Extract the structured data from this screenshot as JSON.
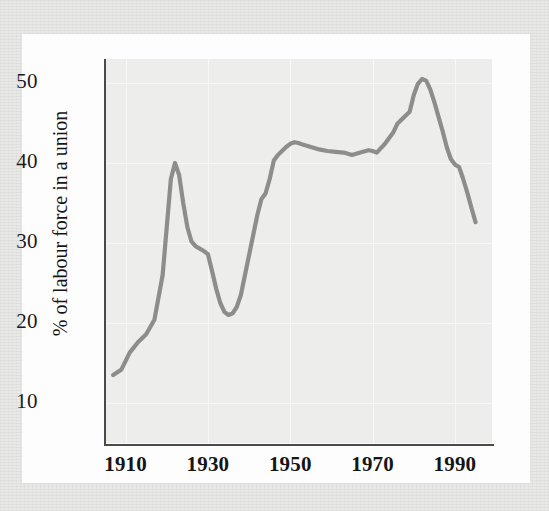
{
  "chart_data": {
    "type": "line",
    "title": "",
    "subtitle": "",
    "xlabel": "",
    "ylabel": "% of labour force in a union",
    "xlim": [
      1905,
      1999
    ],
    "ylim": [
      5,
      53
    ],
    "grid": true,
    "legend": "none",
    "x_ticks": [
      "1910",
      "1930",
      "1950",
      "1970",
      "1990"
    ],
    "x_tick_values": [
      1910,
      1930,
      1950,
      1970,
      1990
    ],
    "y_ticks": [
      "10",
      "20",
      "30",
      "40",
      "50"
    ],
    "y_tick_values": [
      10,
      20,
      30,
      40,
      50
    ],
    "series": [
      {
        "name": "Union density",
        "color": "#8d8d8d",
        "x": [
          1907,
          1909,
          1911,
          1913,
          1915,
          1917,
          1919,
          1920,
          1921,
          1922,
          1923,
          1924,
          1925,
          1926,
          1927,
          1928,
          1929,
          1930,
          1931,
          1932,
          1933,
          1934,
          1935,
          1936,
          1937,
          1938,
          1939,
          1940,
          1941,
          1942,
          1943,
          1944,
          1945,
          1946,
          1947,
          1948,
          1949,
          1950,
          1951,
          1952,
          1953,
          1955,
          1957,
          1959,
          1961,
          1963,
          1965,
          1967,
          1969,
          1970,
          1971,
          1973,
          1975,
          1976,
          1977,
          1978,
          1979,
          1980,
          1981,
          1982,
          1983,
          1984,
          1985,
          1986,
          1987,
          1988,
          1989,
          1990,
          1991,
          1992,
          1993,
          1994,
          1995
        ],
        "y": [
          13.5,
          14.2,
          16.3,
          17.6,
          18.6,
          20.4,
          26.0,
          32.0,
          38.0,
          40.0,
          38.5,
          35.0,
          32.0,
          30.2,
          29.6,
          29.3,
          29.0,
          28.6,
          26.5,
          24.3,
          22.5,
          21.4,
          21.0,
          21.2,
          22.0,
          23.5,
          26.0,
          28.5,
          31.0,
          33.5,
          35.5,
          36.2,
          38.0,
          40.3,
          41.0,
          41.5,
          42.0,
          42.4,
          42.6,
          42.5,
          42.3,
          42.0,
          41.7,
          41.5,
          41.4,
          41.3,
          41.0,
          41.3,
          41.6,
          41.5,
          41.3,
          42.4,
          43.8,
          44.9,
          45.4,
          45.9,
          46.4,
          48.5,
          49.9,
          50.5,
          50.3,
          49.2,
          47.6,
          45.8,
          44.0,
          42.0,
          40.5,
          39.8,
          39.5,
          38.0,
          36.3,
          34.4,
          32.6
        ]
      }
    ],
    "note": "Union membership as a share of the labour force, 1907-1995; peak near 50.5% around 1980, trough near 21% in the mid-1930s."
  },
  "axes": {
    "y_title": "% of labour force in a union"
  }
}
